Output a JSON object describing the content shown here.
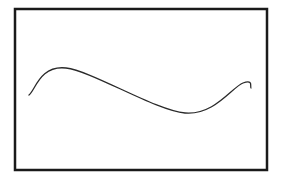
{
  "diagram": {
    "type": "wave-curve-in-frame",
    "frame": {
      "x": 15,
      "y": 9,
      "width": 252,
      "height": 161,
      "stroke": "#1a1a1a",
      "stroke_width": 2.5
    },
    "curve": {
      "stroke": "#2a2a2a",
      "stroke_width": 1.3,
      "points": [
        {
          "x": 29,
          "y": 95,
          "role": "start"
        },
        {
          "x": 66,
          "y": 68,
          "role": "peak"
        },
        {
          "x": 185,
          "y": 113,
          "role": "trough"
        },
        {
          "x": 243,
          "y": 83,
          "role": "second-peak"
        },
        {
          "x": 251,
          "y": 88,
          "role": "end"
        }
      ]
    }
  }
}
